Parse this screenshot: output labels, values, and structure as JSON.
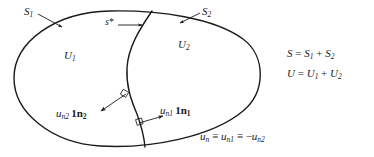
{
  "figure": {
    "name": "two-region-domain-normal-vectors-diagram",
    "stroke_color": "#1a1a1a",
    "background_color": "#ffffff",
    "labels": {
      "outer_surface_left": {
        "base": "S",
        "sub": "1"
      },
      "outer_surface_right": {
        "base": "S",
        "sub": "2"
      },
      "interface_surface": {
        "base": "s",
        "sup": "*",
        "text": "s*"
      },
      "region_left": {
        "base": "U",
        "sub": "1"
      },
      "region_right": {
        "base": "U",
        "sub": "2"
      },
      "normal_vector_left": {
        "u": "u",
        "u_sub": "n2",
        "unit": "1n",
        "unit_sub": "2",
        "text": "u_n2 1n_2"
      },
      "normal_vector_right": {
        "u": "u",
        "u_sub": "n1",
        "unit": "1n",
        "unit_sub": "1",
        "text": "u_n1 1n_1"
      },
      "normal_identity": {
        "lhs": "u",
        "lhs_sub": "n",
        "op1": "≡",
        "mid": "u",
        "mid_sub": "n1",
        "op2": "≡",
        "rhs_sign": "−",
        "rhs": "u",
        "rhs_sub": "n2",
        "text": "u_n ≡ u_n1 ≡ −u_n2"
      }
    },
    "equations": [
      {
        "id": "surface-sum",
        "lhs": "S",
        "eq": "=",
        "term1": "S",
        "term1_sub": "1",
        "plus": "+",
        "term2": "S",
        "term2_sub": "2",
        "text": "S = S1 + S2"
      },
      {
        "id": "volume-sum",
        "lhs": "U",
        "eq": "=",
        "term1": "U",
        "term1_sub": "1",
        "plus": "+",
        "term2": "U",
        "term2_sub": "2",
        "text": "U = U1 + U2"
      }
    ]
  }
}
